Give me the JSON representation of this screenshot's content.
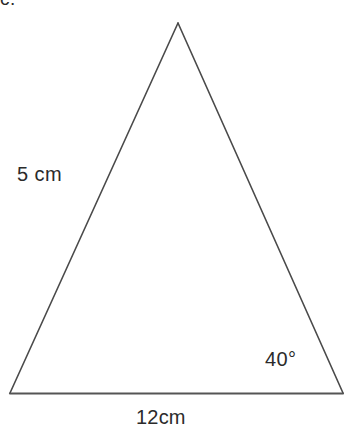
{
  "figure": {
    "item_letter": "c.",
    "background_color": "#ffffff",
    "stroke_color": "#4a4a4a",
    "base_stroke_color": "#555555",
    "text_color": "#2b2b2b",
    "shape_name": "triangle",
    "vertices": {
      "apex": {
        "x": 178,
        "y": 23
      },
      "bottom_left": {
        "x": 10,
        "y": 393
      },
      "bottom_right": {
        "x": 343,
        "y": 393
      }
    },
    "labels": {
      "left_side": "5 cm",
      "base": "12cm",
      "bottom_right_angle": "40°"
    }
  }
}
